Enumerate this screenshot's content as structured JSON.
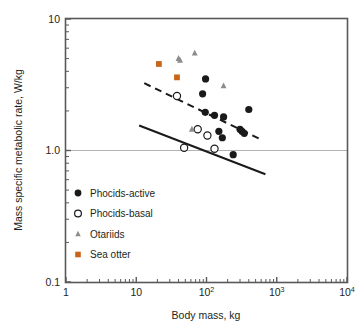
{
  "figure": {
    "background": "#ffffff",
    "frame_color": "#58595b",
    "gridline_color": "#b3b3b3"
  },
  "axes": {
    "y": {
      "title": "Mass specific metabolic rate, W/kg",
      "ticks": [
        {
          "label": "10",
          "value": 10
        },
        {
          "label": "1.0",
          "value": 1.0
        },
        {
          "label": "0.1",
          "value": 0.1
        }
      ],
      "limits": [
        0.1,
        10
      ],
      "scale": "log"
    },
    "x": {
      "title": "Body mass, kg",
      "ticks": [
        {
          "label": "1",
          "base": "1",
          "exp": "",
          "value": 1
        },
        {
          "label": "10",
          "base": "10",
          "exp": "",
          "value": 10
        },
        {
          "label": "100",
          "base": "10",
          "exp": "2",
          "value": 100
        },
        {
          "label": "1000",
          "base": "10",
          "exp": "3",
          "value": 1000
        },
        {
          "label": "10000",
          "base": "10",
          "exp": "4",
          "value": 10000
        }
      ],
      "limits": [
        1,
        10000
      ],
      "scale": "log"
    }
  },
  "legend": {
    "position": "inside-lower-left",
    "entries": [
      {
        "label": "Phocids-active",
        "marker": "filled-circle",
        "color": "#1a1a1a"
      },
      {
        "label": "Phocids-basal",
        "marker": "open-circle",
        "color": "#1a1a1a"
      },
      {
        "label": "Otariids",
        "marker": "filled-triangle",
        "color": "#8c8c8c"
      },
      {
        "label": "Sea otter",
        "marker": "filled-square",
        "color": "#c8651b"
      }
    ]
  },
  "chart_data": {
    "type": "scatter",
    "title": "",
    "subtitle": "",
    "xlabel": "Body mass, kg",
    "ylabel": "Mass specific metabolic rate, W/kg",
    "xscale": "log",
    "yscale": "log",
    "xlim": [
      1,
      10000
    ],
    "ylim": [
      0.1,
      10
    ],
    "grid": "horizontal-at-1.0-only",
    "legend_position": "inside-lower-left",
    "series": [
      {
        "name": "Phocids-active",
        "marker": "filled-circle",
        "color": "#1a1a1a",
        "points": [
          {
            "x": 97,
            "y": 3.5
          },
          {
            "x": 88,
            "y": 2.7
          },
          {
            "x": 96,
            "y": 1.95
          },
          {
            "x": 130,
            "y": 1.85
          },
          {
            "x": 175,
            "y": 1.8
          },
          {
            "x": 150,
            "y": 1.4
          },
          {
            "x": 168,
            "y": 1.25
          },
          {
            "x": 300,
            "y": 1.45
          },
          {
            "x": 320,
            "y": 1.4
          },
          {
            "x": 345,
            "y": 1.35
          },
          {
            "x": 400,
            "y": 2.05
          },
          {
            "x": 240,
            "y": 0.93
          }
        ]
      },
      {
        "name": "Phocids-basal",
        "marker": "open-circle",
        "color": "#1a1a1a",
        "points": [
          {
            "x": 38,
            "y": 2.6
          },
          {
            "x": 75,
            "y": 1.45
          },
          {
            "x": 103,
            "y": 1.3
          },
          {
            "x": 48,
            "y": 1.05
          },
          {
            "x": 130,
            "y": 1.03
          }
        ]
      },
      {
        "name": "Otariids",
        "marker": "filled-triangle",
        "color": "#8c8c8c",
        "points": [
          {
            "x": 40,
            "y": 5.0
          },
          {
            "x": 42,
            "y": 4.85
          },
          {
            "x": 68,
            "y": 5.5
          },
          {
            "x": 175,
            "y": 3.1
          },
          {
            "x": 62,
            "y": 1.45
          }
        ]
      },
      {
        "name": "Sea otter",
        "marker": "filled-square",
        "color": "#c8651b",
        "points": [
          {
            "x": 21,
            "y": 4.55
          },
          {
            "x": 38,
            "y": 3.6
          }
        ]
      }
    ],
    "trend_lines": [
      {
        "name": "active-regression",
        "style": "dashed",
        "color": "#1a1a1a",
        "x_start": 13,
        "y_start": 3.25,
        "x_end": 620,
        "y_end": 1.2
      },
      {
        "name": "basal-regression",
        "style": "solid",
        "color": "#1a1a1a",
        "x_start": 11,
        "y_start": 1.55,
        "x_end": 690,
        "y_end": 0.66
      }
    ],
    "reference_lines": [
      {
        "name": "y-1.0-gridline",
        "axis": "y",
        "value": 1.0,
        "color": "#b3b3b3"
      }
    ]
  }
}
